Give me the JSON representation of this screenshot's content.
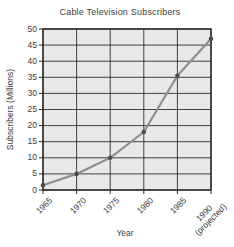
{
  "chart": {
    "title": "Cable Television Subscribers",
    "y_axis_title": "Subscribers (Millions)",
    "x_axis_title": "Year"
  },
  "chart_data": {
    "type": "line",
    "title": "Cable Television Subscribers",
    "xlabel": "Year",
    "ylabel": "Subscribers (Millions)",
    "categories": [
      "1965",
      "1970",
      "1975",
      "1980",
      "1985",
      "1990 (projected)"
    ],
    "values": [
      1.5,
      5,
      10,
      18,
      35.5,
      47
    ],
    "ylim": [
      0,
      50
    ],
    "yticks": [
      0,
      5,
      10,
      15,
      20,
      25,
      30,
      35,
      40,
      45,
      50
    ],
    "grid": true,
    "legend": "none",
    "colors": {
      "plot_bg": "#e9e9e9",
      "grid": "#2e2e2e",
      "axis": "#2e2e2e",
      "line": "#8f8f8f",
      "point": "#4d4d4d",
      "text": "#3d3d3d",
      "background": "#ffffff"
    }
  }
}
